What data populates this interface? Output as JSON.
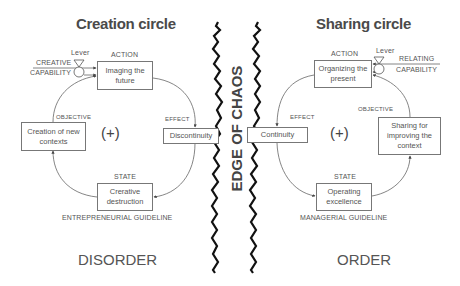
{
  "left_circle": {
    "title": "Creation circle",
    "lever_label": "Lever",
    "input_label_1": "CREATIVE",
    "input_label_2": "CAPABILITY",
    "action_label": "ACTION",
    "action_box": "Imaging the future",
    "objective_label": "OBJECTIVE",
    "objective_box": "Creation of new contexts",
    "effect_label": "EFFECT",
    "effect_box": "Discontinuity",
    "state_label": "STATE",
    "state_box": "Crerative destruction",
    "loop_sign": "(+)",
    "guideline": "ENTREPRENEURIAL GUIDELINE",
    "region": "DISORDER"
  },
  "right_circle": {
    "title": "Sharing circle",
    "lever_label": "Lever",
    "input_label_1": "RELATING",
    "input_label_2": "CAPABILITY",
    "action_label": "ACTION",
    "action_box": "Organizing the present",
    "objective_label": "OBJECTIVE",
    "objective_box": "Sharing for improving the context",
    "effect_label": "EFFECT",
    "effect_box": "Continuity",
    "state_label": "STATE",
    "state_box": "Operating excellence",
    "loop_sign": "(+)",
    "guideline": "MANAGERIAL GUIDELINE",
    "region": "ORDER"
  },
  "center": {
    "label": "EDGE OF CHAOS"
  },
  "colors": {
    "line": "#555555",
    "wave": "#111111",
    "text": "#555555"
  }
}
